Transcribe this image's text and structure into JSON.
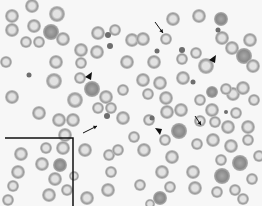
{
  "image": {
    "kind": "blood-smear-micrograph",
    "width": 262,
    "height": 206,
    "background_color": "#f7f7f7",
    "cell_rim_color": "#9a9a9a",
    "cell_center_color": "#e2e2e2",
    "dense_cell_color": "#8a8a8a",
    "annotation_color": "#111111"
  },
  "cells": [
    {
      "x": 12,
      "y": 16,
      "r": 7
    },
    {
      "x": 32,
      "y": 6,
      "r": 7
    },
    {
      "x": 57,
      "y": 14,
      "r": 8
    },
    {
      "x": 12,
      "y": 30,
      "r": 7
    },
    {
      "x": 34,
      "y": 26,
      "r": 7
    },
    {
      "x": 51,
      "y": 32,
      "r": 8,
      "dense": true
    },
    {
      "x": 63,
      "y": 39,
      "r": 7
    },
    {
      "x": 26,
      "y": 42,
      "r": 6
    },
    {
      "x": 39,
      "y": 42,
      "r": 6
    },
    {
      "x": 81,
      "y": 50,
      "r": 7
    },
    {
      "x": 97,
      "y": 52,
      "r": 7
    },
    {
      "x": 98,
      "y": 33,
      "r": 7
    },
    {
      "x": 115,
      "y": 30,
      "r": 6
    },
    {
      "x": 6,
      "y": 62,
      "r": 6
    },
    {
      "x": 56,
      "y": 62,
      "r": 7
    },
    {
      "x": 81,
      "y": 63,
      "r": 6
    },
    {
      "x": 127,
      "y": 62,
      "r": 7
    },
    {
      "x": 54,
      "y": 81,
      "r": 8
    },
    {
      "x": 80,
      "y": 78,
      "r": 6
    },
    {
      "x": 92,
      "y": 89,
      "r": 8,
      "dense": true
    },
    {
      "x": 123,
      "y": 90,
      "r": 6
    },
    {
      "x": 12,
      "y": 97,
      "r": 7
    },
    {
      "x": 75,
      "y": 100,
      "r": 8
    },
    {
      "x": 106,
      "y": 97,
      "r": 7
    },
    {
      "x": 132,
      "y": 40,
      "r": 7
    },
    {
      "x": 173,
      "y": 19,
      "r": 7
    },
    {
      "x": 199,
      "y": 16,
      "r": 7
    },
    {
      "x": 221,
      "y": 19,
      "r": 7,
      "dense": true
    },
    {
      "x": 143,
      "y": 39,
      "r": 7
    },
    {
      "x": 166,
      "y": 39,
      "r": 6
    },
    {
      "x": 222,
      "y": 38,
      "r": 7
    },
    {
      "x": 232,
      "y": 48,
      "r": 7
    },
    {
      "x": 250,
      "y": 40,
      "r": 7
    },
    {
      "x": 196,
      "y": 53,
      "r": 6
    },
    {
      "x": 182,
      "y": 59,
      "r": 6
    },
    {
      "x": 154,
      "y": 62,
      "r": 7
    },
    {
      "x": 206,
      "y": 66,
      "r": 8
    },
    {
      "x": 244,
      "y": 56,
      "r": 8,
      "dense": true
    },
    {
      "x": 253,
      "y": 66,
      "r": 7
    },
    {
      "x": 160,
      "y": 83,
      "r": 7
    },
    {
      "x": 183,
      "y": 78,
      "r": 7
    },
    {
      "x": 233,
      "y": 94,
      "r": 7
    },
    {
      "x": 143,
      "y": 80,
      "r": 7
    },
    {
      "x": 212,
      "y": 92,
      "r": 6,
      "dense": true
    },
    {
      "x": 226,
      "y": 89,
      "r": 6
    },
    {
      "x": 243,
      "y": 88,
      "r": 7
    },
    {
      "x": 200,
      "y": 100,
      "r": 6
    },
    {
      "x": 148,
      "y": 94,
      "r": 6
    },
    {
      "x": 166,
      "y": 98,
      "r": 7
    },
    {
      "x": 254,
      "y": 100,
      "r": 6
    },
    {
      "x": 39,
      "y": 113,
      "r": 7
    },
    {
      "x": 59,
      "y": 120,
      "r": 7
    },
    {
      "x": 73,
      "y": 120,
      "r": 7
    },
    {
      "x": 65,
      "y": 135,
      "r": 7
    },
    {
      "x": 85,
      "y": 150,
      "r": 7
    },
    {
      "x": 109,
      "y": 155,
      "r": 6
    },
    {
      "x": 118,
      "y": 150,
      "r": 6
    },
    {
      "x": 111,
      "y": 172,
      "r": 6
    },
    {
      "x": 123,
      "y": 118,
      "r": 7
    },
    {
      "x": 98,
      "y": 108,
      "r": 6
    },
    {
      "x": 111,
      "y": 108,
      "r": 6
    },
    {
      "x": 21,
      "y": 154,
      "r": 7
    },
    {
      "x": 46,
      "y": 148,
      "r": 6
    },
    {
      "x": 63,
      "y": 148,
      "r": 7
    },
    {
      "x": 18,
      "y": 172,
      "r": 7
    },
    {
      "x": 42,
      "y": 164,
      "r": 7
    },
    {
      "x": 60,
      "y": 165,
      "r": 7,
      "dense": true
    },
    {
      "x": 13,
      "y": 186,
      "r": 6
    },
    {
      "x": 55,
      "y": 179,
      "r": 7
    },
    {
      "x": 49,
      "y": 195,
      "r": 7
    },
    {
      "x": 67,
      "y": 190,
      "r": 6
    },
    {
      "x": 74,
      "y": 176,
      "r": 5
    },
    {
      "x": 8,
      "y": 200,
      "r": 6
    },
    {
      "x": 87,
      "y": 198,
      "r": 7
    },
    {
      "x": 108,
      "y": 190,
      "r": 7
    },
    {
      "x": 167,
      "y": 112,
      "r": 7
    },
    {
      "x": 181,
      "y": 110,
      "r": 7
    },
    {
      "x": 212,
      "y": 110,
      "r": 7
    },
    {
      "x": 236,
      "y": 113,
      "r": 6
    },
    {
      "x": 149,
      "y": 120,
      "r": 6
    },
    {
      "x": 179,
      "y": 131,
      "r": 8,
      "dense": true
    },
    {
      "x": 200,
      "y": 121,
      "r": 6
    },
    {
      "x": 215,
      "y": 122,
      "r": 6
    },
    {
      "x": 228,
      "y": 127,
      "r": 7
    },
    {
      "x": 248,
      "y": 127,
      "r": 7
    },
    {
      "x": 134,
      "y": 137,
      "r": 6
    },
    {
      "x": 165,
      "y": 140,
      "r": 6
    },
    {
      "x": 197,
      "y": 144,
      "r": 6
    },
    {
      "x": 213,
      "y": 140,
      "r": 7
    },
    {
      "x": 231,
      "y": 146,
      "r": 7
    },
    {
      "x": 248,
      "y": 140,
      "r": 6
    },
    {
      "x": 144,
      "y": 150,
      "r": 7
    },
    {
      "x": 172,
      "y": 157,
      "r": 7
    },
    {
      "x": 221,
      "y": 160,
      "r": 6
    },
    {
      "x": 240,
      "y": 163,
      "r": 8,
      "dense": true
    },
    {
      "x": 259,
      "y": 156,
      "r": 6
    },
    {
      "x": 162,
      "y": 172,
      "r": 7
    },
    {
      "x": 193,
      "y": 172,
      "r": 7
    },
    {
      "x": 222,
      "y": 176,
      "r": 8,
      "dense": true
    },
    {
      "x": 252,
      "y": 179,
      "r": 6
    },
    {
      "x": 140,
      "y": 185,
      "r": 6
    },
    {
      "x": 170,
      "y": 187,
      "r": 6
    },
    {
      "x": 195,
      "y": 188,
      "r": 7
    },
    {
      "x": 217,
      "y": 192,
      "r": 6
    },
    {
      "x": 235,
      "y": 190,
      "r": 6
    },
    {
      "x": 160,
      "y": 198,
      "r": 7,
      "dense": true
    },
    {
      "x": 243,
      "y": 199,
      "r": 6
    },
    {
      "x": 150,
      "y": 204,
      "r": 5
    }
  ],
  "small_bodies": [
    {
      "x": 108,
      "y": 35,
      "r": 3
    },
    {
      "x": 110,
      "y": 46,
      "r": 3
    },
    {
      "x": 29,
      "y": 75,
      "r": 2.5
    },
    {
      "x": 218,
      "y": 30,
      "r": 2.5
    },
    {
      "x": 157,
      "y": 51,
      "r": 2.5
    },
    {
      "x": 182,
      "y": 50,
      "r": 3
    },
    {
      "x": 193,
      "y": 82,
      "r": 2.5
    },
    {
      "x": 107,
      "y": 116,
      "r": 3
    },
    {
      "x": 152,
      "y": 118,
      "r": 2.5
    },
    {
      "x": 226,
      "y": 112,
      "r": 2
    }
  ],
  "annotations": {
    "arrows": [
      {
        "x1": 155,
        "y1": 22,
        "x2": 163,
        "y2": 33
      },
      {
        "x1": 83,
        "y1": 133,
        "x2": 97,
        "y2": 126
      },
      {
        "x1": 195,
        "y1": 116,
        "x2": 201,
        "y2": 125
      }
    ],
    "arrowheads": [
      {
        "x": 89,
        "y": 76,
        "dir": "left"
      },
      {
        "x": 213,
        "y": 59,
        "dir": "left"
      },
      {
        "x": 159,
        "y": 132,
        "dir": "down"
      },
      {
        "x": 234,
        "y": 189,
        "dir": "none"
      }
    ],
    "inset_box": {
      "x": 5,
      "y": 138,
      "width": 68,
      "height": 68
    }
  }
}
